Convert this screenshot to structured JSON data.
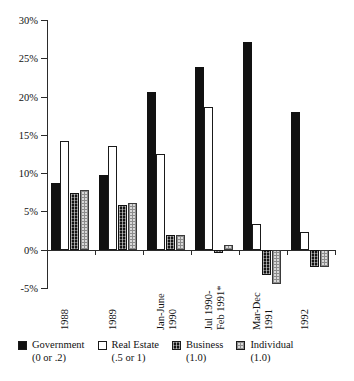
{
  "chart_data": {
    "type": "bar",
    "title": "",
    "subtitle": "",
    "xlabel": "",
    "ylabel": "",
    "ylim": [
      -5,
      30
    ],
    "yticks": [
      30,
      25,
      20,
      15,
      10,
      5,
      0,
      -5
    ],
    "ytick_labels": [
      "30%",
      "25%",
      "20%",
      "15%",
      "10%",
      "5%",
      "0%",
      "-5%"
    ],
    "grid": false,
    "legend_position": "bottom",
    "categories": [
      "1988",
      "1989",
      "Jan-June 1990",
      "Jul 1990-Feb 1991*",
      "Mar-Dec 1991",
      "1992"
    ],
    "category_lines": [
      [
        "1988",
        ""
      ],
      [
        "1989",
        ""
      ],
      [
        "Jan-June",
        "1990"
      ],
      [
        "Jul 1990-",
        "Feb 1991*"
      ],
      [
        "Mar-Dec",
        "1991"
      ],
      [
        "1992",
        ""
      ]
    ],
    "series": [
      {
        "name": "Government",
        "sublabel": "(0 or .2)",
        "fill": "solid-black",
        "values": [
          8.7,
          9.7,
          20.6,
          23.9,
          27.1,
          18.0
        ]
      },
      {
        "name": "Real Estate",
        "sublabel": "(.5 or 1)",
        "fill": "open-white",
        "values": [
          14.2,
          13.6,
          12.5,
          18.6,
          3.4,
          2.3
        ]
      },
      {
        "name": "Business",
        "sublabel": "(1.0)",
        "fill": "dark-crosshatch",
        "values": [
          7.4,
          5.9,
          1.9,
          -0.4,
          -3.3,
          -2.2
        ]
      },
      {
        "name": "Individual",
        "sublabel": "(1.0)",
        "fill": "light-stipple",
        "values": [
          7.8,
          6.1,
          1.9,
          0.6,
          -4.5,
          -2.2
        ]
      }
    ]
  },
  "legend": {
    "items": [
      {
        "label": "Government",
        "sub": "(0 or .2)"
      },
      {
        "label": "Real Estate",
        "sub": "(.5 or 1)"
      },
      {
        "label": "Business",
        "sub": "(1.0)"
      },
      {
        "label": "Individual",
        "sub": "(1.0)"
      }
    ]
  },
  "colors": {
    "axis": "#2b2b2b",
    "solid": "#111111",
    "open": "#ffffff",
    "crosshatch": "#141414",
    "stipple": "#d9d9d9",
    "background": "#ffffff"
  }
}
